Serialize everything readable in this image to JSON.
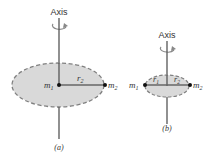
{
  "figure_a": {
    "axis_label": "Axis",
    "mass1": "m",
    "mass1_sub": "1",
    "mass2": "m",
    "mass2_sub": "2",
    "radius": "r",
    "radius_sub": "2",
    "caption": "(a)"
  },
  "figure_b": {
    "axis_label": "Axis",
    "mass1": "m",
    "mass1_sub": "1",
    "mass2": "m",
    "mass2_sub": "2",
    "radius1": "r",
    "radius1_sub": "1",
    "radius2": "r",
    "radius2_sub": "2",
    "caption": "(b)"
  },
  "colors": {
    "disk_fill": "#d9d9d9",
    "disk_border": "#808080",
    "axis": "#555555",
    "rod": "#666666",
    "mass": "#111111"
  }
}
